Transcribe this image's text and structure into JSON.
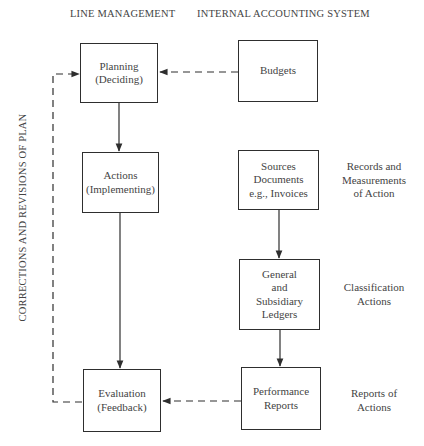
{
  "headers": {
    "left": "LINE MANAGEMENT",
    "right": "INTERNAL ACCOUNTING SYSTEM"
  },
  "side_label": "CORRECTIONS AND REVISIONS OF PLAN",
  "boxes": {
    "planning": [
      "Planning",
      "(Deciding)"
    ],
    "actions": [
      "Actions",
      "(Implementing)"
    ],
    "evaluation": [
      "Evaluation",
      "(Feedback)"
    ],
    "budgets": [
      "Budgets"
    ],
    "sources": [
      "Sources",
      "Documents",
      "e.g., Invoices"
    ],
    "ledgers": [
      "General",
      "and",
      "Subsidiary",
      "Ledgers"
    ],
    "performance": [
      "Performance",
      "Reports"
    ]
  },
  "notes": {
    "records": [
      "Records and",
      "Measurements",
      "of Action"
    ],
    "classification": [
      "Classification",
      "Actions"
    ],
    "reports": [
      "Reports of",
      "Actions"
    ]
  },
  "connections": [
    {
      "from": "planning",
      "to": "actions",
      "style": "solid"
    },
    {
      "from": "actions",
      "to": "evaluation",
      "style": "solid"
    },
    {
      "from": "budgets",
      "to": "planning",
      "style": "dashed"
    },
    {
      "from": "sources",
      "to": "ledgers",
      "style": "solid"
    },
    {
      "from": "ledgers",
      "to": "performance",
      "style": "solid"
    },
    {
      "from": "performance",
      "to": "evaluation",
      "style": "dashed"
    },
    {
      "from": "evaluation",
      "to": "planning",
      "style": "dashed",
      "label": "side_label"
    }
  ],
  "colors": {
    "line": "#2e2e2e",
    "text": "#444444"
  }
}
